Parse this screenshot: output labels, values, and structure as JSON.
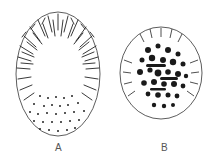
{
  "figure": {
    "panels": [
      {
        "id": "A",
        "label": "A",
        "description": "oval body with radial streaks and clear central area, dotted lower region"
      },
      {
        "id": "B",
        "label": "B",
        "description": "smaller oval body with dense dark mottled reticulate pattern"
      }
    ],
    "colors": {
      "ink": "#222222",
      "background": "#ffffff",
      "label": "#555555"
    }
  }
}
